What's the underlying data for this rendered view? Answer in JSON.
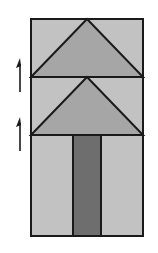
{
  "diagram": {
    "colors": {
      "background": "#ffffff",
      "light_fill": "#c2c2c2",
      "medium_fill": "#a6a6a6",
      "dark_fill": "#6e6e6e",
      "outline": "#1a1a1a"
    },
    "block": {
      "x": 31,
      "y": 19,
      "width": 112,
      "height": 217
    },
    "rows": [
      {
        "name": "top-triangle-row",
        "y": 19,
        "height": 58,
        "apex_x": 87
      },
      {
        "name": "middle-triangle-row",
        "y": 77,
        "height": 58,
        "apex_x": 87
      },
      {
        "name": "stem-row",
        "y": 135,
        "height": 101
      }
    ],
    "stem": {
      "x": 73,
      "width": 28
    },
    "arrows": [
      {
        "name": "upper-arrow",
        "x": 19,
        "y_top": 58,
        "y_bottom": 92
      },
      {
        "name": "lower-arrow",
        "x": 19,
        "y_top": 117,
        "y_bottom": 151
      }
    ]
  }
}
